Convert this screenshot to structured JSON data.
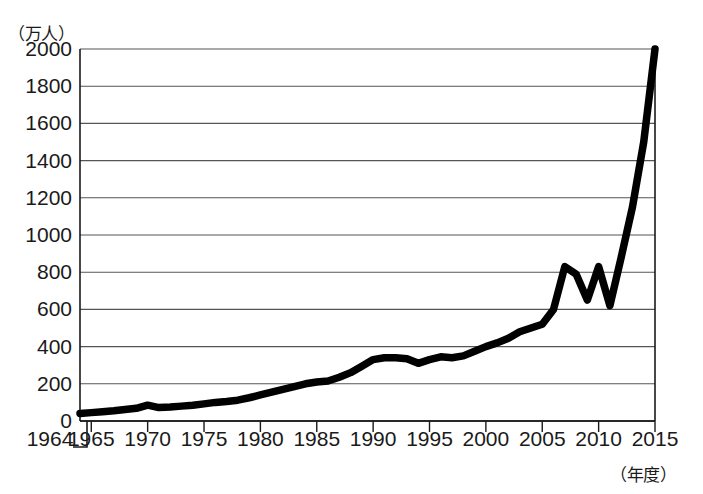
{
  "chart_data": {
    "type": "line",
    "title": "",
    "xlabel": "（年度）",
    "ylabel": "（万人）",
    "xlim": [
      1964,
      2015
    ],
    "ylim": [
      0,
      2000
    ],
    "grid": true,
    "legend": null,
    "y_ticks": [
      "0",
      "200",
      "400",
      "600",
      "800",
      "1000",
      "1200",
      "1400",
      "1600",
      "1800",
      "2000"
    ],
    "y_tick_values": [
      0,
      200,
      400,
      600,
      800,
      1000,
      1200,
      1400,
      1600,
      1800,
      2000
    ],
    "x_ticks": [
      "1964",
      "1965",
      "1970",
      "1975",
      "1980",
      "1985",
      "1990",
      "1995",
      "2000",
      "2005",
      "2010",
      "2015"
    ],
    "x_tick_values": [
      1964,
      1965,
      1970,
      1975,
      1980,
      1985,
      1990,
      1995,
      2000,
      2005,
      2010,
      2015
    ],
    "x": [
      1964,
      1965,
      1966,
      1967,
      1968,
      1969,
      1970,
      1971,
      1972,
      1973,
      1974,
      1975,
      1976,
      1977,
      1978,
      1979,
      1980,
      1981,
      1982,
      1983,
      1984,
      1985,
      1986,
      1987,
      1988,
      1989,
      1990,
      1991,
      1992,
      1993,
      1994,
      1995,
      1996,
      1997,
      1998,
      1999,
      2000,
      2001,
      2002,
      2003,
      2004,
      2005,
      2006,
      2007,
      2008,
      2009,
      2010,
      2011,
      2012,
      2013,
      2014,
      2015
    ],
    "values": [
      40,
      45,
      50,
      55,
      62,
      68,
      85,
      72,
      75,
      80,
      85,
      92,
      100,
      105,
      112,
      125,
      140,
      155,
      170,
      185,
      200,
      210,
      215,
      235,
      260,
      295,
      330,
      340,
      340,
      335,
      310,
      330,
      345,
      340,
      350,
      375,
      400,
      420,
      445,
      480,
      500,
      520,
      600,
      830,
      790,
      650,
      830,
      620,
      880,
      1150,
      1500,
      2000
    ],
    "unit_note": "万人",
    "series": [
      {
        "name": "訪日外客数",
        "values": [
          40,
          45,
          50,
          55,
          62,
          68,
          85,
          72,
          75,
          80,
          85,
          92,
          100,
          105,
          112,
          125,
          140,
          155,
          170,
          185,
          200,
          210,
          215,
          235,
          260,
          295,
          330,
          340,
          340,
          335,
          310,
          330,
          345,
          340,
          350,
          375,
          400,
          420,
          445,
          480,
          500,
          520,
          600,
          830,
          790,
          650,
          830,
          620,
          880,
          1150,
          1500,
          2000
        ]
      }
    ],
    "line_color": "#000000",
    "grid_color": "#555555"
  }
}
